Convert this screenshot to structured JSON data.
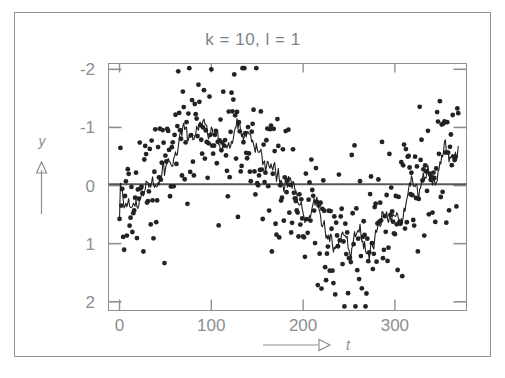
{
  "figure": {
    "title": "k =  10, l =   1",
    "background": "#ffffff",
    "border_color": "#8d9296"
  },
  "axes": {
    "y_label": "y",
    "x_label": "t",
    "y_ticks": [
      "2",
      "1",
      "0",
      "-1",
      "-2"
    ],
    "x_ticks": [
      "0",
      "100",
      "200",
      "300"
    ],
    "frame_color": "#8b9095",
    "zero_line_color": "#55595c",
    "tick_color": "#8b9095"
  },
  "series": {
    "scatter_name": "observations",
    "scatter_color": "#232323",
    "line_name": "moving-average",
    "line_color": "#1f1f1f"
  },
  "chart_data": {
    "type": "scatter",
    "title": "k =  10, l =   1",
    "xlabel": "t",
    "ylabel": "y",
    "xlim": [
      -12,
      378
    ],
    "ylim": [
      -2.15,
      2.1
    ],
    "xticks": [
      0,
      100,
      200,
      300
    ],
    "yticks": [
      -2,
      -1,
      0,
      1,
      2
    ],
    "grid": false,
    "legend": "none",
    "annotations": [
      "k = 10",
      "l = 1"
    ],
    "model": {
      "description": "noisy sinusoid with moving-average smoother, k=10 window, l=1",
      "n_points": 370,
      "x_start": 0,
      "x_step": 1,
      "signal_amplitude": 0.95,
      "signal_period": 300,
      "signal_phase": -0.55,
      "noise_sigma": 0.62,
      "smoother_window": 10,
      "seed": 20240517
    },
    "series": [
      {
        "name": "observations",
        "type": "scatter",
        "marker": "dot",
        "marker_size": 2.4,
        "color": "#232323"
      },
      {
        "name": "moving-average",
        "type": "line",
        "color": "#1f1f1f",
        "width": 1.1
      }
    ],
    "summary": {
      "peak_value": 1.25,
      "peak_at_t": 85,
      "trough_value": -1.0,
      "trough_at_t": 265,
      "zero_crossing_down_at_t": 190,
      "end_value": 0.35
    }
  }
}
